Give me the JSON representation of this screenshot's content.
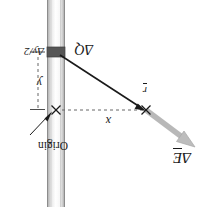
{
  "figure": {
    "orientation_note": "artwork printed upside down (rotated 180 degrees)",
    "background_color": "#ffffff"
  },
  "labels": {
    "delta_E": {
      "delta": "Δ",
      "symbol": "E",
      "vector": true
    },
    "origin": "Origin",
    "x": "x",
    "r": {
      "symbol": "r",
      "vector": true
    },
    "y": "y",
    "delta_Q": {
      "delta": "Δ",
      "symbol": "Q"
    },
    "delta_y_over_2": {
      "text": "Δy/2"
    }
  },
  "colors": {
    "field_arrow": "#b3b3b3",
    "field_arrow_edge": "#9a9a9a",
    "r_vector": "#1a1a1a",
    "charge_element": "#4d4d4d",
    "rod_light": "#f2f2f2",
    "rod_mid": "#d9d9d9",
    "rod_dark": "#9e9e9e",
    "rod_outline": "#8c8c8c",
    "dashed": "#666666",
    "text": "#1a1a1a"
  },
  "geometry": {
    "rod": {
      "x_left": 143,
      "x_right": 161,
      "y_top": 0,
      "y_bottom": 207
    },
    "origin_point": {
      "x": 152,
      "y": 97
    },
    "field_point": {
      "x": 62,
      "y": 97
    },
    "charge_element": {
      "x": 152,
      "y": 155
    },
    "delta_E_arrow": {
      "from_x": 62,
      "from_y": 97,
      "to_x": 14,
      "to_y": 62
    },
    "dashed_horizontal": {
      "x1": 64,
      "y1": 97,
      "x2": 150,
      "y2": 97
    },
    "dashed_vertical": {
      "x1": 170,
      "y1": 100,
      "x2": 170,
      "y2": 152
    }
  }
}
